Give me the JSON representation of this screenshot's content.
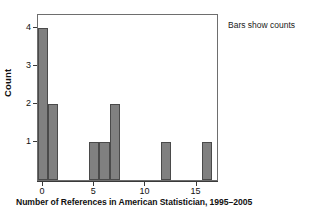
{
  "chart_data": {
    "type": "bar",
    "title": "",
    "subtitle": "",
    "xlabel": "Number of References in American Statistician, 1995–2005",
    "ylabel": "Count",
    "categories": [
      0,
      1,
      5,
      6,
      7,
      12,
      16
    ],
    "values": [
      4,
      2,
      1,
      1,
      2,
      1,
      1
    ],
    "series": [
      {
        "name": "counts",
        "values": [
          4,
          2,
          1,
          1,
          2,
          1,
          1
        ]
      }
    ],
    "xlim": [
      -0.5,
      17.0
    ],
    "ylim": [
      0,
      4.35
    ],
    "xticks": [
      0,
      5,
      10,
      15
    ],
    "xtick_labels": [
      "0",
      "5",
      "10",
      "15"
    ],
    "yticks": [
      1,
      2,
      3,
      4
    ],
    "ytick_labels": [
      "1",
      "2",
      "3",
      "4"
    ],
    "grid": false,
    "legend": null,
    "legend_position": "none",
    "annotations": [
      {
        "text": "Bars show counts",
        "position": "outside-top-right"
      }
    ],
    "bar_width": 1,
    "colors": {
      "bar_fill": "#808080",
      "bar_edge": "#4a4a4a",
      "frame": "#6e6e6e",
      "axis": "#3a3a3a",
      "text": "#111111",
      "background": "#ffffff"
    }
  }
}
